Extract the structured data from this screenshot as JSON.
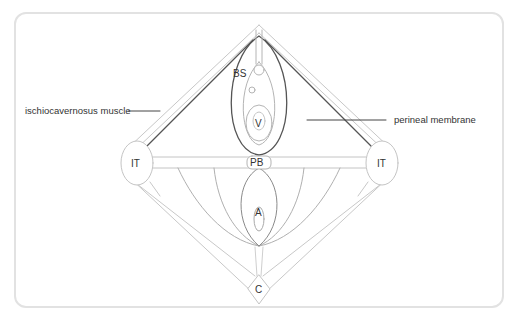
{
  "diagram": {
    "callouts": {
      "left": "ischiocavernosus muscle",
      "right": "perineal membrane"
    },
    "labels": {
      "bulb": "BS",
      "vagina": "V",
      "perineal_body": "PB",
      "anus": "A",
      "coccyx": "C",
      "ischial_tuberosity_left": "IT",
      "ischial_tuberosity_right": "IT"
    },
    "colors": {
      "outline_light": "#c4c4c4",
      "outline_dark": "#555555",
      "frame": "#e2e2e2",
      "text": "#333333"
    }
  }
}
